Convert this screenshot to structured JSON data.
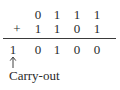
{
  "diagram": {
    "title": "",
    "operation": "binary-addition",
    "addend_1": {
      "digits": [
        "0",
        "1",
        "1",
        "1"
      ]
    },
    "addend_2": {
      "operator": "+",
      "digits": [
        "1",
        "1",
        "0",
        "1"
      ]
    },
    "sum": {
      "digits": [
        "1",
        "0",
        "1",
        "0",
        "0"
      ]
    },
    "annotation": {
      "arrow_icon": "up-arrow-icon",
      "arrow_glyph": "↑",
      "label": "Carry-out"
    }
  }
}
